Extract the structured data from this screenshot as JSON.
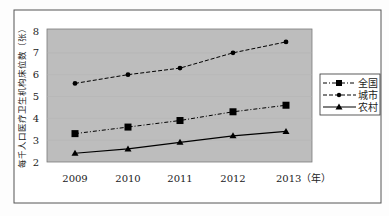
{
  "chart_data": {
    "type": "line",
    "title": "",
    "xlabel": "（年）",
    "ylabel": "每千人口医疗卫生机构床位数（张）",
    "categories": [
      "2009",
      "2010",
      "2011",
      "2012",
      "2013"
    ],
    "ylim": [
      2,
      8
    ],
    "yticks": [
      2,
      3,
      4,
      5,
      6,
      7,
      8
    ],
    "grid": true,
    "legend_position": "right",
    "series": [
      {
        "name": "全国",
        "values": [
          3.3,
          3.6,
          3.9,
          4.3,
          4.6
        ],
        "marker": "square",
        "line_style": "dash-dot",
        "color": "#000000"
      },
      {
        "name": "城市",
        "values": [
          5.6,
          6.0,
          6.3,
          7.0,
          7.5
        ],
        "marker": "circle",
        "line_style": "dashed",
        "color": "#000000"
      },
      {
        "name": "农村",
        "values": [
          2.4,
          2.6,
          2.9,
          3.2,
          3.4
        ],
        "marker": "triangle",
        "line_style": "solid",
        "color": "#000000"
      }
    ]
  },
  "axis": {
    "x_labels": [
      "2009",
      "2010",
      "2011",
      "2012",
      "2013（年）"
    ],
    "y_labels": [
      "8",
      "7",
      "6",
      "5",
      "4",
      "3",
      "2"
    ],
    "y_title": "每千人口医疗卫生机构床位数（张）"
  },
  "legend": {
    "items": [
      {
        "label": "全国"
      },
      {
        "label": "城市"
      },
      {
        "label": "农村"
      }
    ]
  },
  "colors": {
    "plot_background": "#bdbdbd",
    "frame": "#555555",
    "line": "#000000"
  }
}
